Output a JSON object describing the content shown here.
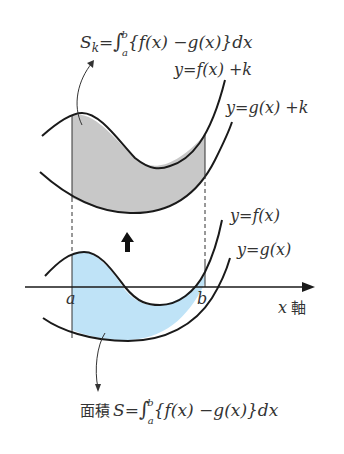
{
  "top_formula": {
    "lhs": "S",
    "lhs_sub": "k",
    "eq": "=",
    "integral": "∫",
    "upper": "b",
    "lower": "a",
    "integrand": "{f(x) −g(x)}dx"
  },
  "labels": {
    "f_plus_k": "y=f(x) +k",
    "g_plus_k": "y=g(x) +k",
    "f": "y=f(x)",
    "g": "y=g(x)",
    "a": "a",
    "b": "b",
    "x_axis_var": "x",
    "x_axis_word": "軸"
  },
  "bottom_formula": {
    "prefix": "面積",
    "lhs": "S",
    "eq": "=",
    "integral": "∫",
    "upper": "b",
    "lower": "a",
    "integrand": "{f(x) −g(x)}dx"
  },
  "colors": {
    "shifted_region": "#c8c8c8",
    "original_region": "#bfe3f7",
    "curve": "#1a1a1a"
  }
}
